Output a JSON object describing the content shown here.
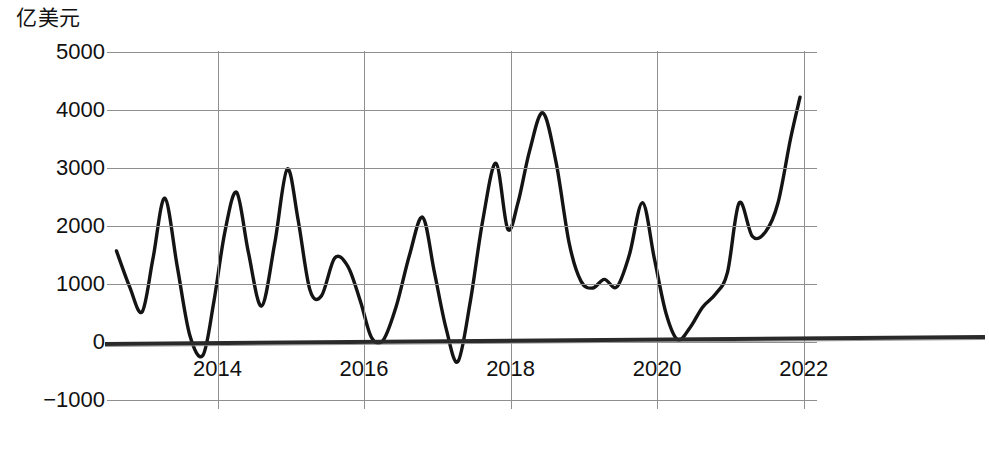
{
  "chart_data": {
    "type": "line",
    "title": "",
    "subtitle": "",
    "unit_label": "亿美元",
    "xlabel": "",
    "ylabel": "亿美元",
    "ylim": [
      -1000,
      5000
    ],
    "xlim": [
      2012.6,
      2022.1
    ],
    "grid": true,
    "legend": null,
    "y_ticks": [
      5000,
      4000,
      3000,
      2000,
      1000,
      0,
      -1000
    ],
    "y_tick_labels": [
      "5000",
      "4000",
      "3000",
      "2000",
      "1000",
      "0",
      "−1000"
    ],
    "x_ticks": [
      2014,
      2016,
      2018,
      2020,
      2022
    ],
    "x_tick_labels": [
      "2014",
      "2016",
      "2018",
      "2020",
      "2022"
    ],
    "zero_reference_line": true,
    "series": [
      {
        "name": "贸易差额",
        "color": "#141414",
        "x": [
          2012.62,
          2012.8,
          2012.97,
          2013.12,
          2013.28,
          2013.45,
          2013.62,
          2013.8,
          2013.95,
          2014.1,
          2014.26,
          2014.42,
          2014.6,
          2014.78,
          2014.95,
          2015.1,
          2015.26,
          2015.42,
          2015.6,
          2015.78,
          2015.95,
          2016.1,
          2016.26,
          2016.44,
          2016.62,
          2016.8,
          2016.96,
          2017.12,
          2017.28,
          2017.45,
          2017.62,
          2017.8,
          2017.96,
          2018.1,
          2018.26,
          2018.44,
          2018.62,
          2018.8,
          2018.96,
          2019.12,
          2019.28,
          2019.45,
          2019.62,
          2019.8,
          2019.96,
          2020.12,
          2020.28,
          2020.45,
          2020.62,
          2020.8,
          2020.96,
          2021.12,
          2021.3,
          2021.48,
          2021.65,
          2021.82,
          2021.95
        ],
        "values": [
          1570,
          950,
          520,
          1450,
          2480,
          1300,
          120,
          -230,
          700,
          1900,
          2580,
          1550,
          620,
          1700,
          2980,
          2100,
          900,
          800,
          1450,
          1300,
          700,
          80,
          30,
          620,
          1500,
          2150,
          1200,
          230,
          -340,
          700,
          2100,
          3080,
          1950,
          2400,
          3300,
          3950,
          3100,
          1700,
          1050,
          930,
          1080,
          950,
          1500,
          2400,
          1450,
          500,
          40,
          250,
          600,
          830,
          1200,
          2400,
          1820,
          1900,
          2400,
          3500,
          4220
        ]
      }
    ],
    "annotations": []
  },
  "axis": {
    "unit_label": "亿美元",
    "y_tick_labels": [
      "5000",
      "4000",
      "3000",
      "2000",
      "1000",
      "0",
      "−1000"
    ],
    "x_tick_labels": [
      "2014",
      "2016",
      "2018",
      "2020",
      "2022"
    ]
  },
  "caption": {
    "text": ""
  }
}
